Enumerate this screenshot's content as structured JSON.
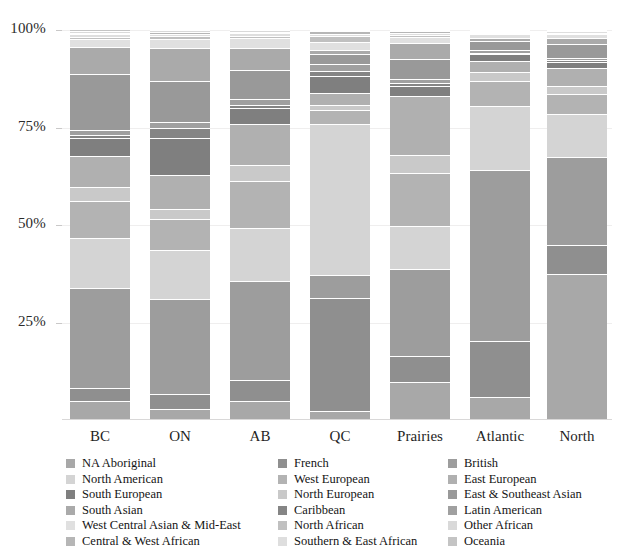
{
  "chart_data": {
    "type": "bar",
    "subtype": "stacked-percentage",
    "title": "",
    "xlabel": "",
    "ylabel": "",
    "ylim": [
      0,
      100
    ],
    "ytick_labels": [
      "100%",
      "75%",
      "50%",
      "25%"
    ],
    "ytick_values": [
      100,
      75,
      50,
      25
    ],
    "grid": true,
    "legend_position": "bottom",
    "categories": [
      "BC",
      "ON",
      "AB",
      "QC",
      "Prairies",
      "Atlantic",
      "North"
    ],
    "series": [
      {
        "name": "NA Aboriginal",
        "color": "#a8a8a8",
        "values": [
          4.5,
          2.5,
          4.5,
          2.0,
          9.0,
          5.0,
          36.0
        ]
      },
      {
        "name": "French",
        "color": "#8f8f8f",
        "values": [
          3.5,
          4.0,
          5.5,
          30.0,
          6.5,
          12.5,
          7.0
        ]
      },
      {
        "name": "British",
        "color": "#9d9d9d",
        "values": [
          25.5,
          24.5,
          25.0,
          6.0,
          21.5,
          38.5,
          22.0
        ]
      },
      {
        "name": "North American",
        "color": "#d4d4d4",
        "values": [
          13.0,
          12.5,
          13.5,
          40.0,
          10.5,
          14.5,
          10.5
        ]
      },
      {
        "name": "West European",
        "color": "#b3b3b3",
        "values": [
          9.5,
          8.0,
          12.0,
          3.5,
          13.0,
          5.5,
          5.0
        ]
      },
      {
        "name": "North European",
        "color": "#c9c9c9",
        "values": [
          3.5,
          2.5,
          4.0,
          1.5,
          4.5,
          2.0,
          2.0
        ]
      },
      {
        "name": "East European",
        "color": "#b0b0b0",
        "values": [
          8.0,
          9.0,
          10.5,
          3.0,
          14.5,
          2.5,
          4.5
        ]
      },
      {
        "name": "South European",
        "color": "#7f7f7f",
        "values": [
          4.5,
          9.5,
          4.0,
          4.5,
          2.5,
          1.5,
          1.5
        ]
      },
      {
        "name": "Caribbean",
        "color": "#858585",
        "values": [
          0.8,
          2.5,
          0.8,
          1.5,
          0.6,
          0.4,
          0.4
        ]
      },
      {
        "name": "Latin American",
        "color": "#a0a0a0",
        "values": [
          1.2,
          1.5,
          1.5,
          1.8,
          1.0,
          0.5,
          0.5
        ]
      },
      {
        "name": "East & Southeast Asian",
        "color": "#999999",
        "values": [
          14.5,
          10.5,
          7.5,
          2.5,
          5.0,
          2.0,
          3.5
        ]
      },
      {
        "name": "South Asian",
        "color": "#aaaaaa",
        "values": [
          7.0,
          8.5,
          5.5,
          1.2,
          4.0,
          0.8,
          1.5
        ]
      },
      {
        "name": "West Central Asian & Mid-East",
        "color": "#e0e0e0",
        "values": [
          2.0,
          2.5,
          2.5,
          2.0,
          1.5,
          0.8,
          1.0
        ]
      },
      {
        "name": "North African",
        "color": "#c0c0c0",
        "values": [
          0.5,
          0.6,
          0.5,
          1.6,
          0.4,
          0.3,
          0.3
        ]
      },
      {
        "name": "Southern & East African",
        "color": "#dedede",
        "values": [
          0.7,
          0.7,
          0.7,
          0.5,
          0.6,
          0.3,
          0.3
        ]
      },
      {
        "name": "Central & West African",
        "color": "#b6b6b6",
        "values": [
          0.4,
          0.5,
          0.4,
          0.8,
          0.3,
          0.2,
          0.2
        ]
      },
      {
        "name": "Other African",
        "color": "#d9d9d9",
        "values": [
          0.4,
          0.4,
          0.4,
          0.4,
          0.3,
          0.2,
          0.2
        ]
      },
      {
        "name": "Oceania",
        "color": "#c4c4c4",
        "values": [
          0.5,
          0.3,
          0.3,
          0.2,
          0.3,
          0.2,
          0.2
        ]
      }
    ]
  },
  "axis": {
    "yticks": [
      {
        "label": "100%",
        "value": 100
      },
      {
        "label": "75%",
        "value": 75
      },
      {
        "label": "50%",
        "value": 50
      },
      {
        "label": "25%",
        "value": 25
      }
    ],
    "xticks": [
      "BC",
      "ON",
      "AB",
      "QC",
      "Prairies",
      "Atlantic",
      "North"
    ]
  },
  "legend": {
    "columns": [
      [
        {
          "label": "NA Aboriginal",
          "color": "#a8a8a8"
        },
        {
          "label": "North American",
          "color": "#d4d4d4"
        },
        {
          "label": "South European",
          "color": "#7f7f7f"
        },
        {
          "label": "South Asian",
          "color": "#aaaaaa"
        },
        {
          "label": "West Central Asian & Mid-East",
          "color": "#e0e0e0"
        },
        {
          "label": "Central & West African",
          "color": "#b6b6b6"
        }
      ],
      [
        {
          "label": "French",
          "color": "#8f8f8f"
        },
        {
          "label": "West European",
          "color": "#b3b3b3"
        },
        {
          "label": "North European",
          "color": "#c9c9c9"
        },
        {
          "label": "Caribbean",
          "color": "#858585"
        },
        {
          "label": "North African",
          "color": "#c0c0c0"
        },
        {
          "label": "Southern & East African",
          "color": "#dedede"
        }
      ],
      [
        {
          "label": "British",
          "color": "#9d9d9d"
        },
        {
          "label": "East European",
          "color": "#b0b0b0"
        },
        {
          "label": "East & Southeast Asian",
          "color": "#999999"
        },
        {
          "label": "Latin American",
          "color": "#a0a0a0"
        },
        {
          "label": "Other African",
          "color": "#d9d9d9"
        },
        {
          "label": "Oceania",
          "color": "#c4c4c4"
        }
      ]
    ]
  }
}
